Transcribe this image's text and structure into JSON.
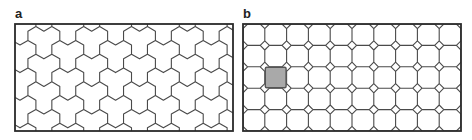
{
  "figure": {
    "background": "#ffffff",
    "line_color": "#4a4a4a",
    "frame_color": "#2a2a2a"
  },
  "panels": [
    {
      "label": "a",
      "description": "Tiling of the plane by three-hexagon (trihex) tiles",
      "tiling": "trihex",
      "frame": {
        "x": 15,
        "y": 24,
        "width": 218,
        "height": 107
      },
      "hex_edge": 9.2,
      "origin_offset": {
        "x": -3,
        "y": -2
      }
    },
    {
      "label": "b",
      "description": "Truncated square (octagon-square) tiling with one highlighted cell",
      "tiling": "octagon-square",
      "frame": {
        "x": 243,
        "y": 24,
        "width": 218,
        "height": 107
      },
      "columns": 10,
      "rows": 5,
      "corner_cut": 4.6,
      "highlight": {
        "column": 1,
        "row": 2,
        "fill": "#a9a9a9",
        "stroke": "#555555"
      }
    }
  ]
}
